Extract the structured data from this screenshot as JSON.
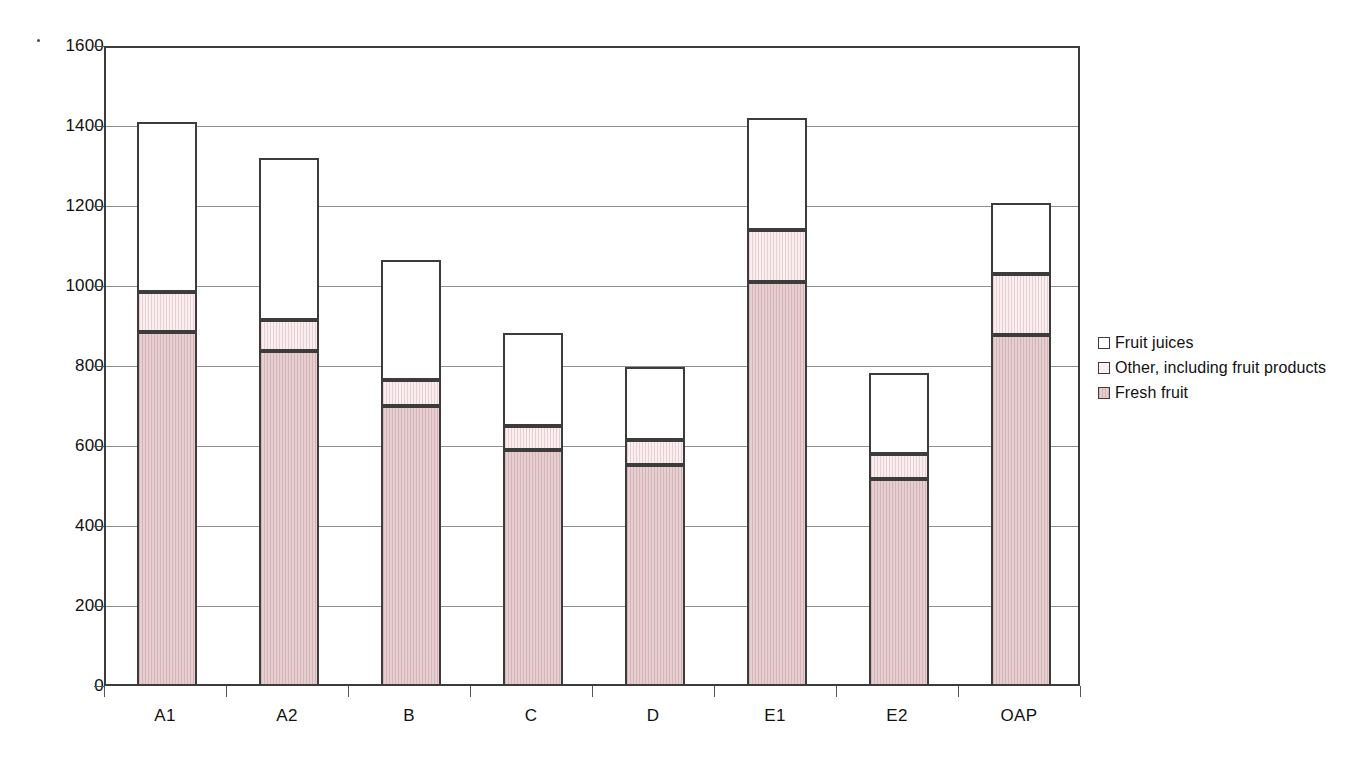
{
  "chart_data": {
    "type": "bar",
    "subtype": "stacked-vertical",
    "title": "",
    "xlabel": "",
    "ylabel": "",
    "ylim": [
      0,
      1600
    ],
    "ytick_step": 200,
    "yticks": [
      "1600",
      "1400",
      "1200",
      "1000",
      "800",
      "600",
      "400",
      "200",
      "0"
    ],
    "grid": true,
    "legend_position": "right",
    "categories": [
      "A1",
      "A2",
      "B",
      "C",
      "D",
      "E1",
      "E2",
      "OAP"
    ],
    "series": [
      {
        "name": "Fruit juices",
        "swatch": "#ffffff",
        "values": [
          425,
          405,
          300,
          233,
          183,
          280,
          203,
          178
        ]
      },
      {
        "name": "Other, including fruit products",
        "swatch": "#f9eff0",
        "values": [
          100,
          77,
          65,
          60,
          63,
          130,
          62,
          152
        ]
      },
      {
        "name": "Fresh fruit",
        "swatch": "#e6cfd1",
        "values": [
          885,
          838,
          700,
          590,
          552,
          1010,
          518,
          878
        ]
      }
    ],
    "totals": [
      1410,
      1320,
      1065,
      883,
      798,
      1420,
      783,
      1208
    ]
  },
  "legend": {
    "items": [
      {
        "label": "Fruit juices"
      },
      {
        "label": "Other, including fruit products"
      },
      {
        "label": "Fresh fruit"
      }
    ]
  },
  "colors": {
    "axis": "#3c3c3c",
    "gridline": "#8e8e8e",
    "fresh_fruit": "#e6cfd1",
    "other_products": "#f9eff0",
    "fruit_juices": "#ffffff",
    "text": "#111111"
  }
}
